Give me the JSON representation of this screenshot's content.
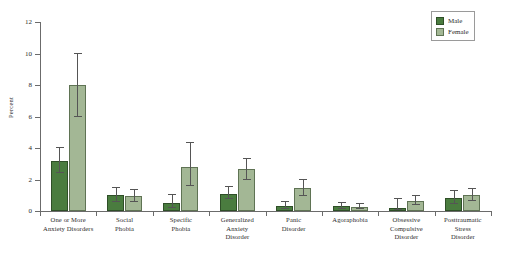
{
  "chart_data": {
    "type": "bar",
    "title": "",
    "xlabel": "",
    "ylabel": "Percent",
    "ylim": [
      0,
      12
    ],
    "yticks": [
      0,
      2,
      4,
      6,
      8,
      10,
      12
    ],
    "grid": false,
    "legend_position": "top-right",
    "categories": [
      "One or More Anxiety Disorders",
      "Social Phobia",
      "Specific Phobia",
      "Generalized Anxiety Disorder",
      "Panic Disorder",
      "Agoraphobia",
      "Obsessive Compulsive Disorder",
      "Posttraumatic Stress Disorder"
    ],
    "category_lines": [
      [
        "One or More",
        "Anxiety Disorders"
      ],
      [
        "Social",
        "Phobia"
      ],
      [
        "Specific",
        "Phobia"
      ],
      [
        "Generalized",
        "Anxiety",
        "Disorder"
      ],
      [
        "Panic",
        "Disorder"
      ],
      [
        "Agoraphobia"
      ],
      [
        "Obsessive",
        "Compulsive",
        "Disorder"
      ],
      [
        "Posttraumatic",
        "Stress",
        "Disorder"
      ]
    ],
    "series": [
      {
        "name": "Male",
        "color": "#4a7c3f",
        "values": [
          3.2,
          1.0,
          0.5,
          1.1,
          0.35,
          0.3,
          0.2,
          0.85
        ],
        "ci_low": [
          2.4,
          0.6,
          0.2,
          0.75,
          0.15,
          0.12,
          0.05,
          0.45
        ],
        "ci_high": [
          4.0,
          1.45,
          1.0,
          1.55,
          0.6,
          0.5,
          0.75,
          1.3
        ]
      },
      {
        "name": "Female",
        "color": "#a3b795",
        "values": [
          8.0,
          0.95,
          2.8,
          2.65,
          1.45,
          0.28,
          0.65,
          1.0
        ],
        "ci_low": [
          6.0,
          0.6,
          1.6,
          2.0,
          0.95,
          0.1,
          0.4,
          0.65
        ],
        "ci_high": [
          10.0,
          1.35,
          4.3,
          3.3,
          2.0,
          0.45,
          0.95,
          1.4
        ]
      }
    ]
  },
  "legend": {
    "items": [
      {
        "label": "Male",
        "key": "male"
      },
      {
        "label": "Female",
        "key": "female"
      }
    ]
  }
}
